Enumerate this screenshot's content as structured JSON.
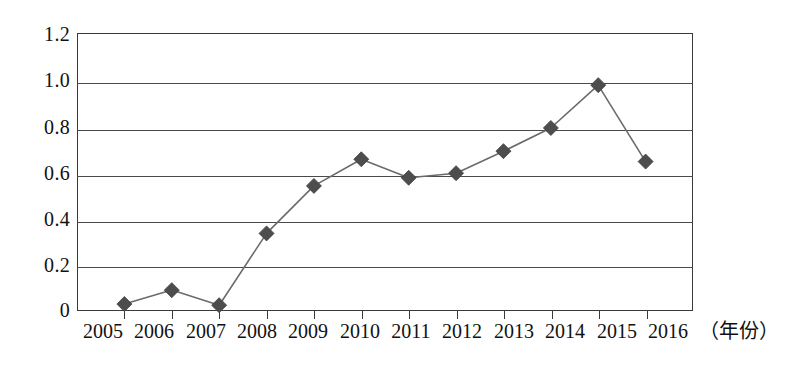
{
  "chart_data": {
    "type": "line",
    "title": "",
    "subtitle": "",
    "xlabel": "（年份）",
    "ylabel": "",
    "categories": [
      "2005",
      "2006",
      "2007",
      "2008",
      "2009",
      "2010",
      "2011",
      "2012",
      "2013",
      "2014",
      "2015",
      "2016"
    ],
    "values": [
      0.03,
      0.09,
      0.025,
      0.335,
      0.54,
      0.655,
      0.575,
      0.595,
      0.69,
      0.79,
      0.975,
      0.645
    ],
    "series": [
      {
        "name": "",
        "values": [
          0.03,
          0.09,
          0.025,
          0.335,
          0.54,
          0.655,
          0.575,
          0.595,
          0.69,
          0.79,
          0.975,
          0.645
        ]
      }
    ],
    "ylim": [
      0,
      1.2
    ],
    "ytick_labels": [
      "1.2",
      "1.0",
      "0.8",
      "0.6",
      "0.4",
      "0.2",
      "0"
    ],
    "ytick_values": [
      1.2,
      1.0,
      0.8,
      0.6,
      0.4,
      0.2,
      0
    ],
    "grid": true,
    "grid_axis": "y",
    "legend": false,
    "legend_position": "none",
    "marker": "diamond",
    "marker_color": "#4d4d4d",
    "line_color": "#6b6b6b",
    "axis_color": "#3a3a3a",
    "background_color": "#ffffff",
    "annotations": []
  },
  "axis_title_label": "（年份）"
}
